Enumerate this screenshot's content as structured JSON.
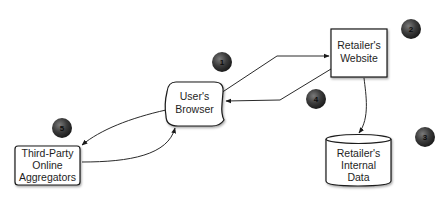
{
  "diagram": {
    "nodes": [
      {
        "id": "browser",
        "label_lines": [
          "User's",
          "Browser"
        ],
        "shape": "rounded-rect"
      },
      {
        "id": "website",
        "label_lines": [
          "Retailer's",
          "Website"
        ],
        "shape": "rect"
      },
      {
        "id": "internal_data",
        "label_lines": [
          "Retailer's",
          "Internal",
          "Data"
        ],
        "shape": "cylinder"
      },
      {
        "id": "aggregators",
        "label_lines": [
          "Third-Party",
          "Online",
          "Aggregators"
        ],
        "shape": "rounded-rect"
      }
    ],
    "badges": [
      {
        "number": "1",
        "near": "browser-to-website edge"
      },
      {
        "number": "2",
        "near": "website"
      },
      {
        "number": "3",
        "near": "internal_data"
      },
      {
        "number": "4",
        "near": "website-to-browser edge"
      },
      {
        "number": "5",
        "near": "aggregators"
      }
    ],
    "edges": [
      {
        "from": "browser",
        "to": "website"
      },
      {
        "from": "website",
        "to": "browser"
      },
      {
        "from": "website",
        "to": "internal_data"
      },
      {
        "from": "browser",
        "to": "aggregators"
      },
      {
        "from": "aggregators",
        "to": "browser"
      }
    ],
    "colors": {
      "badge_fill": "#3a3a3a",
      "badge_highlight": "#6a6a6a",
      "stroke": "#1a1a1a",
      "background": "#ffffff"
    }
  }
}
